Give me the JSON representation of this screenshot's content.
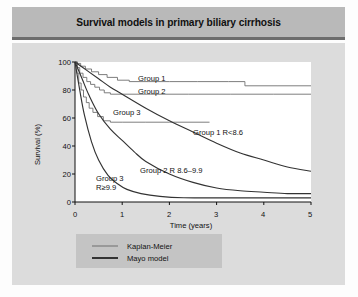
{
  "figure": {
    "title": "Survival models in primary biliary cirrhosis"
  },
  "legend": {
    "items": [
      {
        "label": "Kaplan-Meier",
        "style": "thin",
        "color": "#6f6f6f"
      },
      {
        "label": "Mayo model",
        "style": "thick",
        "color": "#333333"
      }
    ]
  },
  "annotations": {
    "group1": "Group 1",
    "group2": "Group 2",
    "group3": "Group 3",
    "group1_mayo": "Group 1 R<8.6",
    "group2_mayo": "Group 2 R 8.6–9.9",
    "group3_mayo_line1": "Group 3",
    "group3_mayo_line2": "R≥9.9"
  },
  "axes": {
    "y_ticks": [
      "100",
      "80",
      "60",
      "40",
      "20",
      "0"
    ],
    "x_ticks": [
      "0",
      "1",
      "2",
      "3",
      "4",
      "5"
    ],
    "ylabel": "Survival (%)",
    "xlabel": "Time (years)"
  },
  "chart_data": {
    "type": "line",
    "title": "Survival models in primary biliary cirrhosis",
    "xlabel": "Time (years)",
    "ylabel": "Survival (%)",
    "xlim": [
      0,
      5
    ],
    "ylim": [
      0,
      100
    ],
    "xticks": [
      0,
      1,
      2,
      3,
      4,
      5
    ],
    "yticks": [
      0,
      20,
      40,
      60,
      80,
      100
    ],
    "grid": false,
    "legend_position": "below-plot",
    "series": [
      {
        "name": "Group 1 Kaplan-Meier",
        "style": "step",
        "model": "Kaplan-Meier",
        "color": "#6f6f6f",
        "x": [
          0,
          0.05,
          0.12,
          0.22,
          0.35,
          0.5,
          0.68,
          0.9,
          1.15,
          1.55,
          2.0,
          2.6,
          3.25,
          3.6,
          4.3,
          5.0
        ],
        "y": [
          100,
          99,
          97,
          95,
          93,
          91,
          89,
          87,
          86,
          86,
          86,
          86,
          86,
          83,
          83,
          83
        ]
      },
      {
        "name": "Group 2 Kaplan-Meier",
        "style": "step",
        "model": "Kaplan-Meier",
        "color": "#6f6f6f",
        "x": [
          0,
          0.05,
          0.1,
          0.17,
          0.25,
          0.33,
          0.42,
          0.52,
          0.62,
          0.75,
          1.0,
          1.6,
          2.4,
          3.3,
          4.2,
          5.0
        ],
        "y": [
          100,
          96,
          92,
          89,
          86,
          84,
          82,
          80,
          78,
          77,
          77,
          77,
          77,
          77,
          77,
          77
        ]
      },
      {
        "name": "Group 3 Kaplan-Meier",
        "style": "step",
        "model": "Kaplan-Meier",
        "color": "#6f6f6f",
        "x": [
          0,
          0.04,
          0.08,
          0.13,
          0.18,
          0.24,
          0.3,
          0.38,
          0.48,
          0.6,
          0.75,
          1.0,
          1.5,
          2.0,
          2.5,
          2.85
        ],
        "y": [
          100,
          92,
          85,
          80,
          75,
          71,
          67,
          64,
          61,
          58,
          57,
          57,
          57,
          57,
          57,
          57
        ]
      },
      {
        "name": "Group 1 Mayo model (R<8.6)",
        "style": "smooth",
        "model": "Mayo model",
        "color": "#333333",
        "x": [
          0,
          0.25,
          0.5,
          0.75,
          1.0,
          1.5,
          2.0,
          2.5,
          3.0,
          3.5,
          4.0,
          4.5,
          5.0
        ],
        "y": [
          100,
          94,
          88,
          82,
          77,
          67,
          58,
          50,
          42,
          35,
          30,
          25,
          22
        ]
      },
      {
        "name": "Group 2 Mayo model (R 8.6-9.9)",
        "style": "smooth",
        "model": "Mayo model",
        "color": "#333333",
        "x": [
          0,
          0.15,
          0.3,
          0.5,
          0.75,
          1.0,
          1.25,
          1.5,
          2.0,
          2.5,
          3.0,
          3.5,
          4.0,
          4.5,
          5.0
        ],
        "y": [
          100,
          88,
          76,
          63,
          52,
          44,
          36,
          29,
          20,
          14,
          10,
          8,
          7,
          6,
          6
        ]
      },
      {
        "name": "Group 3 Mayo model (R>=9.9)",
        "style": "smooth",
        "model": "Mayo model",
        "color": "#333333",
        "x": [
          0,
          0.1,
          0.2,
          0.35,
          0.5,
          0.7,
          0.9,
          1.1,
          1.4,
          1.8,
          2.3,
          3.0,
          4.0,
          5.0
        ],
        "y": [
          100,
          80,
          62,
          43,
          30,
          19,
          13,
          9,
          6,
          4,
          3,
          3,
          3,
          3
        ]
      }
    ]
  }
}
